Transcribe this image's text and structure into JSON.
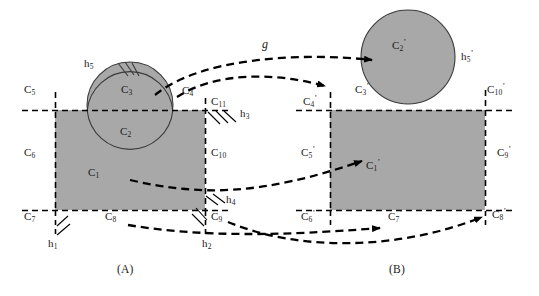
{
  "figure": {
    "caption_a": "(A)",
    "caption_b": "(B)",
    "mapping_label": "g",
    "colors": {
      "fill_gray": "#a8a8a8",
      "stroke": "#000000",
      "background": "#ffffff"
    },
    "panel_a": {
      "cells": [
        {
          "id": "C1",
          "label": "C",
          "sub": "1",
          "sup": "",
          "x": 88,
          "y": 172
        },
        {
          "id": "C2",
          "label": "C",
          "sub": "2",
          "sup": "",
          "x": 120,
          "y": 131
        },
        {
          "id": "C3",
          "label": "C",
          "sub": "3",
          "sup": "",
          "x": 121,
          "y": 89
        },
        {
          "id": "C4",
          "label": "C",
          "sub": "4",
          "sup": "",
          "x": 182,
          "y": 90
        },
        {
          "id": "C5",
          "label": "C",
          "sub": "5",
          "sup": "",
          "x": 24,
          "y": 89
        },
        {
          "id": "C6",
          "label": "C",
          "sub": "6",
          "sup": "",
          "x": 24,
          "y": 152
        },
        {
          "id": "C7",
          "label": "C",
          "sub": "7",
          "sup": "",
          "x": 24,
          "y": 216
        },
        {
          "id": "C8",
          "label": "C",
          "sub": "8",
          "sup": "",
          "x": 105,
          "y": 216
        },
        {
          "id": "C9",
          "label": "C",
          "sub": "9",
          "sup": "",
          "x": 216,
          "y": 216
        },
        {
          "id": "C10",
          "label": "C",
          "sub": "10",
          "sup": "",
          "x": 216,
          "y": 152
        },
        {
          "id": "C11",
          "label": "C",
          "sub": "11",
          "sup": "",
          "x": 216,
          "y": 101
        }
      ],
      "walls": [
        {
          "id": "h1",
          "label": "h",
          "sub": "1",
          "sup": "",
          "x": 48,
          "y": 243
        },
        {
          "id": "h2",
          "label": "h",
          "sub": "2",
          "sup": "",
          "x": 202,
          "y": 243
        },
        {
          "id": "h3",
          "label": "h",
          "sub": "3",
          "sup": "",
          "x": 243,
          "y": 113
        },
        {
          "id": "h4",
          "label": "h",
          "sub": "4",
          "sup": "",
          "x": 228,
          "y": 199
        },
        {
          "id": "h5",
          "label": "h",
          "sub": "5",
          "sup": "",
          "x": 84,
          "y": 63
        }
      ]
    },
    "panel_b": {
      "cells": [
        {
          "id": "C1p",
          "label": "C",
          "sub": "1",
          "sup": "'",
          "x": 366,
          "y": 165
        },
        {
          "id": "C2p",
          "label": "C",
          "sub": "2",
          "sup": "'",
          "x": 396,
          "y": 45
        },
        {
          "id": "C3p",
          "label": "C",
          "sub": "3",
          "sup": "'",
          "x": 357,
          "y": 89
        },
        {
          "id": "C4p",
          "label": "C",
          "sub": "4",
          "sup": "'",
          "x": 308,
          "y": 101
        },
        {
          "id": "C5p",
          "label": "C",
          "sub": "5",
          "sup": "'",
          "x": 305,
          "y": 152
        },
        {
          "id": "C6p",
          "label": "C",
          "sub": "6",
          "sup": "'",
          "x": 305,
          "y": 216
        },
        {
          "id": "C7p",
          "label": "C",
          "sub": "7",
          "sup": "'",
          "x": 392,
          "y": 216
        },
        {
          "id": "C8p",
          "label": "C",
          "sub": "8",
          "sup": "'",
          "x": 496,
          "y": 216
        },
        {
          "id": "C9p",
          "label": "C",
          "sub": "9",
          "sup": "'",
          "x": 500,
          "y": 152
        },
        {
          "id": "C10p",
          "label": "C",
          "sub": "10",
          "sup": "'",
          "x": 490,
          "y": 89
        }
      ],
      "walls": [
        {
          "id": "h5p",
          "label": "h",
          "sub": "5",
          "sup": "'",
          "x": 463,
          "y": 56
        }
      ]
    }
  }
}
